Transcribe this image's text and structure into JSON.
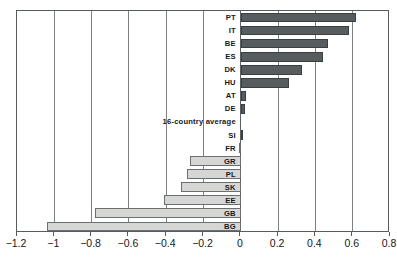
{
  "chart_data": {
    "type": "bar",
    "orientation": "horizontal",
    "title": "",
    "subtitle": "",
    "xlabel": "",
    "ylabel": "",
    "xlim": [
      -1.2,
      0.8
    ],
    "ylim": null,
    "grid": true,
    "legend": null,
    "legend_position": "none",
    "xticks": [
      "-1.2",
      "-1",
      "-0.8",
      "-0.6",
      "-0.4",
      "-0.2",
      "0",
      "0.2",
      "0.4",
      "0.6",
      "0.8"
    ],
    "xtick_values": [
      -1.2,
      -1.0,
      -0.8,
      -0.6,
      -0.4,
      -0.2,
      0,
      0.2,
      0.4,
      0.6,
      0.8
    ],
    "categories": [
      "PT",
      "IT",
      "BE",
      "ES",
      "DK",
      "HU",
      "AT",
      "DE",
      "16-country average",
      "SI",
      "FR",
      "GR",
      "PL",
      "SK",
      "EE",
      "GB",
      "BG"
    ],
    "values": [
      0.62,
      0.58,
      0.47,
      0.44,
      0.33,
      0.26,
      0.03,
      0.02,
      0.0,
      0.005,
      -0.01,
      -0.27,
      -0.29,
      -0.32,
      -0.41,
      -0.78,
      -1.04
    ],
    "bars": [
      {
        "label": "PT",
        "value": 0.62,
        "sign": "pos"
      },
      {
        "label": "IT",
        "value": 0.58,
        "sign": "pos"
      },
      {
        "label": "BE",
        "value": 0.47,
        "sign": "pos"
      },
      {
        "label": "ES",
        "value": 0.44,
        "sign": "pos"
      },
      {
        "label": "DK",
        "value": 0.33,
        "sign": "pos"
      },
      {
        "label": "HU",
        "value": 0.26,
        "sign": "pos"
      },
      {
        "label": "AT",
        "value": 0.03,
        "sign": "pos"
      },
      {
        "label": "DE",
        "value": 0.02,
        "sign": "pos"
      },
      {
        "label": "16-country average",
        "value": 0.0,
        "sign": "zero"
      },
      {
        "label": "SI",
        "value": 0.005,
        "sign": "pos"
      },
      {
        "label": "FR",
        "value": -0.01,
        "sign": "neg"
      },
      {
        "label": "GR",
        "value": -0.27,
        "sign": "neg"
      },
      {
        "label": "PL",
        "value": -0.29,
        "sign": "neg"
      },
      {
        "label": "SK",
        "value": -0.32,
        "sign": "neg"
      },
      {
        "label": "EE",
        "value": -0.41,
        "sign": "neg"
      },
      {
        "label": "GB",
        "value": -0.78,
        "sign": "neg"
      },
      {
        "label": "BG",
        "value": -1.04,
        "sign": "neg"
      }
    ],
    "colors": {
      "positive_bar": "#575c5f",
      "negative_bar": "#d6d6d4",
      "bar_outline": "#4b5053",
      "gridline": "#7c8184",
      "frame": "#555b5e",
      "text": "#16181a",
      "background": "#ffffff"
    }
  }
}
